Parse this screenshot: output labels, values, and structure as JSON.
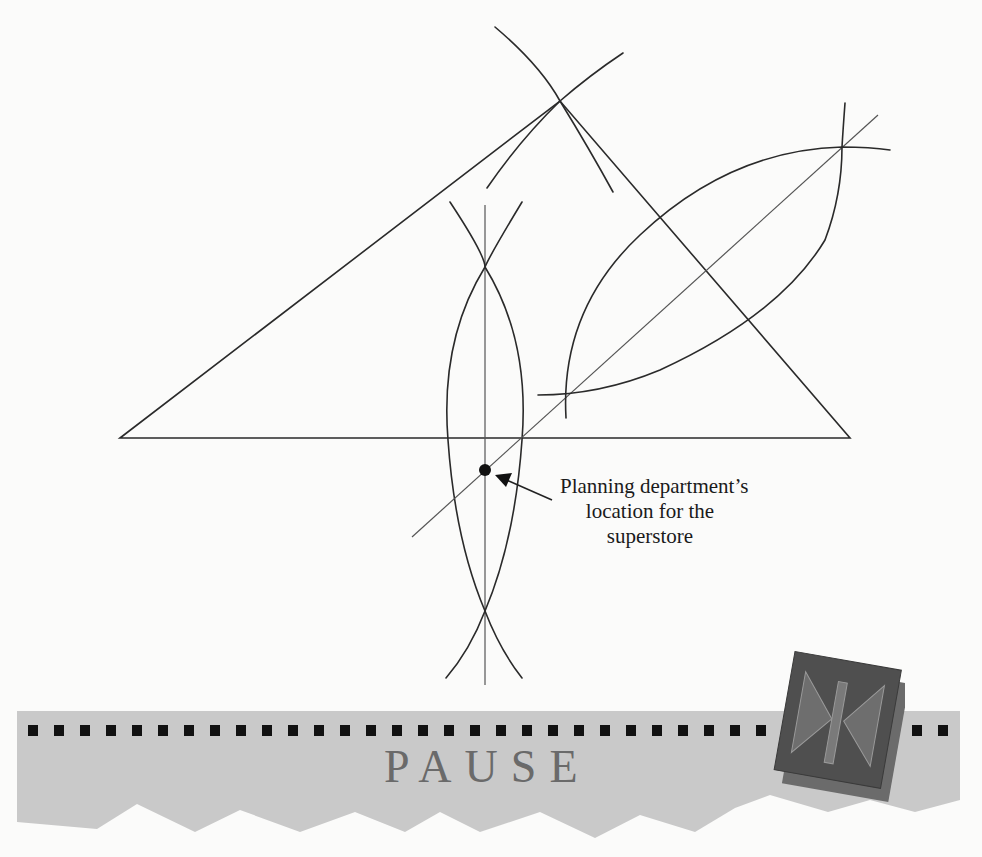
{
  "diagram": {
    "callout": {
      "lines": [
        "Planning department’s",
        "location for the",
        "superstore"
      ]
    },
    "triangle": {
      "vertices": [
        [
          120,
          438
        ],
        [
          560,
          101
        ],
        [
          850,
          438
        ]
      ]
    },
    "marked_point": [
      485,
      470
    ]
  },
  "banner": {
    "label": "PAUSE",
    "icon": "pause-icon",
    "colors": {
      "banner": "#c9c9c9",
      "squares": "#111111",
      "label": "#6a6a6a",
      "icon_face": "#4f4f4f",
      "icon_shadow": "#6b6b6b"
    }
  }
}
